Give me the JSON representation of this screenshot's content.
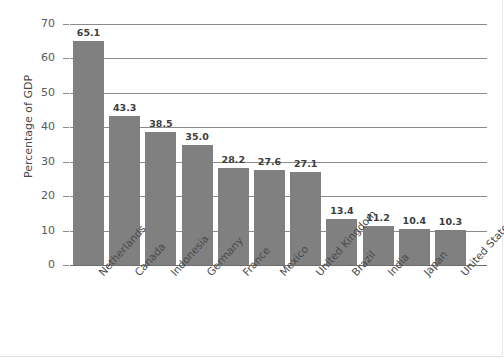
{
  "chart_data": {
    "type": "bar",
    "title": "",
    "xlabel": "",
    "ylabel": "Percentage of GDP",
    "ylim": [
      0,
      70
    ],
    "yticks": [
      0,
      10,
      20,
      30,
      40,
      50,
      60,
      70
    ],
    "ytick_labels": [
      "0",
      "10",
      "20",
      "30",
      "40",
      "50",
      "60",
      "70"
    ],
    "grid": true,
    "legend": "none",
    "bar_color": "#808080",
    "categories": [
      "Netherlands",
      "Canada",
      "Indonesia",
      "Germany",
      "France",
      "Mexico",
      "United Kingdom",
      "Brazil",
      "India",
      "Japan",
      "United States"
    ],
    "values": [
      65.1,
      43.3,
      38.5,
      35.0,
      28.2,
      27.6,
      27.1,
      13.4,
      11.2,
      10.4,
      10.3
    ],
    "value_labels": [
      "65.1",
      "43.3",
      "38.5",
      "35.0",
      "28.2",
      "27.6",
      "27.1",
      "13.4",
      "11.2",
      "10.4",
      "10.3"
    ]
  }
}
